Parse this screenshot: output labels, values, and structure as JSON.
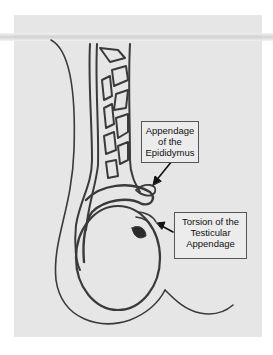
{
  "figure": {
    "type": "anatomical line drawing"
  },
  "labels": [
    {
      "id": "appendage-epididymis",
      "lines": [
        "Appendage",
        "of the",
        "Epididymus"
      ]
    },
    {
      "id": "torsion-testicular-appendage",
      "lines": [
        "Torsion of the",
        "Testicular",
        "Appendage"
      ]
    }
  ],
  "colors": {
    "background": "#e6e6e6",
    "ink": "#3a3a3a",
    "label_border": "#555555"
  }
}
